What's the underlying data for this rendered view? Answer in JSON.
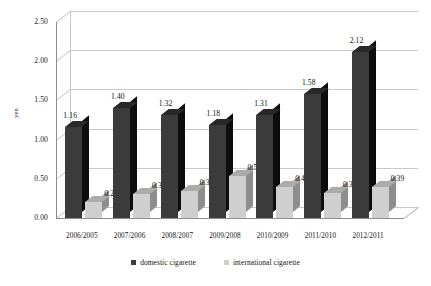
{
  "chart_data": {
    "type": "bar",
    "title": "",
    "xlabel": "",
    "ylabel": "yen",
    "ylim": [
      0,
      2.5
    ],
    "ytick_step": 0.5,
    "ytick_labels": [
      "0.00",
      "0.50",
      "1.00",
      "1.50",
      "2.00",
      "2.50"
    ],
    "grid": true,
    "legend_position": "bottom",
    "style": "3d-clustered-column",
    "categories": [
      "2006/2005",
      "2007/2006",
      "2008/2007",
      "2009/2008",
      "2010/2009",
      "2011/2010",
      "2012/2011"
    ],
    "series": [
      {
        "name": "domestic cigarette",
        "color": "#3b3b3b",
        "values": [
          1.16,
          1.4,
          1.32,
          1.18,
          1.31,
          1.58,
          2.12
        ],
        "labels": [
          "1.16",
          "1.40",
          "1.32",
          "1.18",
          "1.31",
          "1.58",
          "2.12"
        ]
      },
      {
        "name": "international cigarette",
        "color": "#cfcfcf",
        "values": [
          0.2,
          0.3,
          0.34,
          0.53,
          0.4,
          0.32,
          0.39
        ],
        "labels": [
          "0.20",
          "0.30",
          "0.34",
          "0.53",
          "0.40",
          "0.32",
          "0.39"
        ]
      }
    ]
  },
  "legend": {
    "items": [
      {
        "label": "domestic cigarette",
        "color": "#3b3b3b"
      },
      {
        "label": "international cigarette",
        "color": "#cfcfcf"
      }
    ]
  }
}
